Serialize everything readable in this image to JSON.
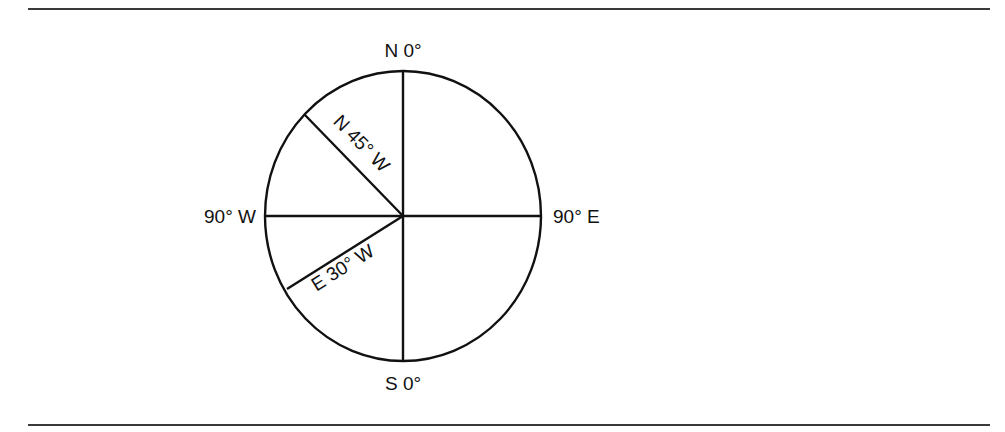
{
  "diagram": {
    "type": "compass-bearings",
    "colors": {
      "stroke": "#111111",
      "rule": "#3a3a3a",
      "background": "#ffffff"
    },
    "cardinal_labels": {
      "north": "N 0°",
      "south": "S 0°",
      "west": "90° W",
      "east": "90° E"
    },
    "bearing_lines": [
      {
        "label": "N 45° W",
        "angle_from_north_deg": 45,
        "direction": "northwest"
      },
      {
        "label": "E 30° W",
        "angle_below_west_deg": 30,
        "direction": "southwest"
      }
    ]
  }
}
